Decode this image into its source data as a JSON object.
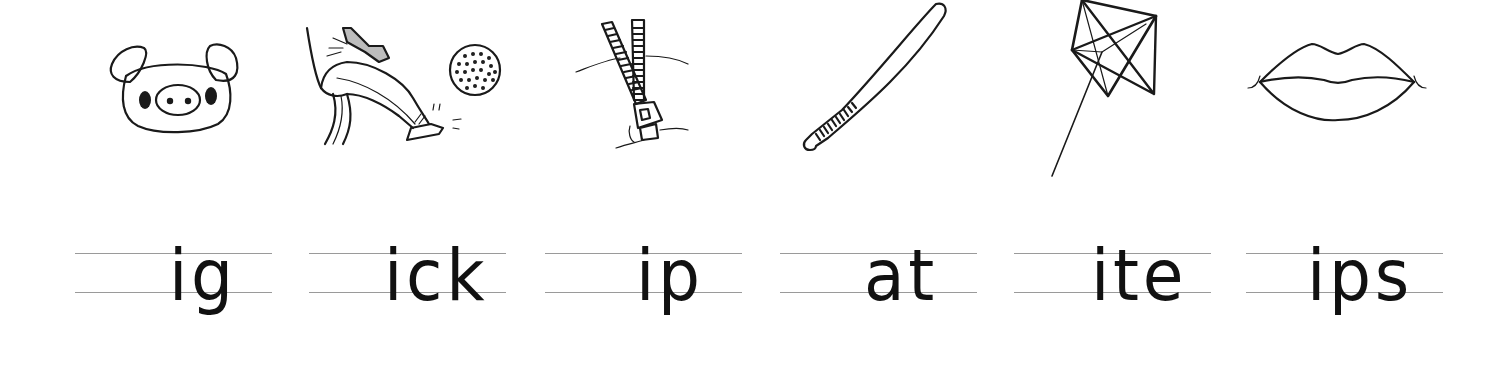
{
  "worksheet": {
    "items": [
      {
        "picture": "pig-face",
        "word_ending": "ig"
      },
      {
        "picture": "leg-kicking-ball",
        "word_ending": "ick"
      },
      {
        "picture": "zipper",
        "word_ending": "ip"
      },
      {
        "picture": "baseball-bat",
        "word_ending": "at"
      },
      {
        "picture": "kite",
        "word_ending": "ite"
      },
      {
        "picture": "lips",
        "word_ending": "ips"
      }
    ]
  },
  "colors": {
    "ink": "#1a1a1a",
    "guide_lines": "#9a9a9a",
    "background": "#ffffff"
  }
}
